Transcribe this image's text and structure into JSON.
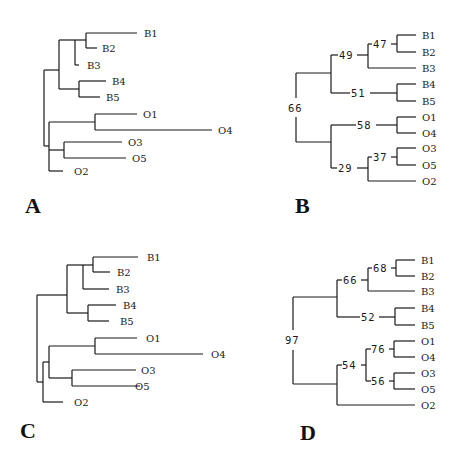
{
  "figure": {
    "panels": [
      {
        "id": "A",
        "label": "A",
        "type": "phylogram",
        "tips": [
          "B1",
          "B2",
          "B3",
          "B4",
          "B5",
          "O1",
          "O4",
          "O3",
          "O5",
          "O2"
        ]
      },
      {
        "id": "B",
        "label": "B",
        "type": "cladogram-with-support",
        "tips": [
          "B1",
          "B2",
          "B3",
          "B4",
          "B5",
          "O1",
          "O4",
          "O3",
          "O5",
          "O2"
        ],
        "support": {
          "root": "66",
          "b123": "49",
          "b12": "47",
          "b45": "51",
          "o14": "58",
          "o352": "29",
          "o35": "37"
        }
      },
      {
        "id": "C",
        "label": "C",
        "type": "phylogram",
        "tips": [
          "B1",
          "B2",
          "B3",
          "B4",
          "B5",
          "O1",
          "O4",
          "O3",
          "O5",
          "O2"
        ]
      },
      {
        "id": "D",
        "label": "D",
        "type": "cladogram-with-support",
        "tips": [
          "B1",
          "B2",
          "B3",
          "B4",
          "B5",
          "O1",
          "O4",
          "O3",
          "O5",
          "O2"
        ],
        "support": {
          "root": "97",
          "b123": "66",
          "b12": "68",
          "b45": "52",
          "o1435": "54",
          "o14": "76",
          "o35": "56"
        }
      }
    ]
  }
}
